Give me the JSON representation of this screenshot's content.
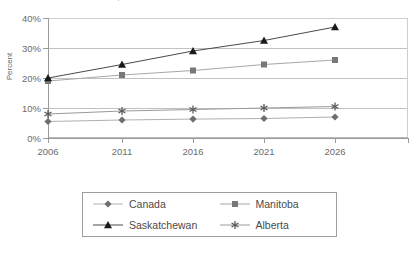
{
  "chart_data": {
    "type": "line",
    "title": "Prairie Provinces, 2006-2026",
    "xlabel": "",
    "ylabel": "Percent",
    "categories": [
      "2006",
      "2011",
      "2016",
      "2021",
      "2026"
    ],
    "x": [
      2006,
      2011,
      2016,
      2021,
      2026
    ],
    "ylim": [
      0,
      40
    ],
    "ytick_labels": [
      "0%",
      "10%",
      "20%",
      "30%",
      "40%"
    ],
    "ytick_values": [
      0,
      10,
      20,
      30,
      40
    ],
    "grid": true,
    "legend_position": "bottom",
    "series": [
      {
        "name": "Canada",
        "marker": "diamond",
        "color": "#6e6e6e",
        "line_color": "#b0b0b0",
        "values": [
          5.5,
          6.0,
          6.3,
          6.5,
          7.0
        ]
      },
      {
        "name": "Manitoba",
        "marker": "square",
        "color": "#787878",
        "line_color": "#a8a8a8",
        "values": [
          19.0,
          21.0,
          22.5,
          24.5,
          26.0
        ]
      },
      {
        "name": "Saskatchewan",
        "marker": "triangle",
        "color": "#1a1a1a",
        "line_color": "#4a4a4a",
        "values": [
          20.0,
          24.5,
          29.0,
          32.5,
          37.0
        ]
      },
      {
        "name": "Alberta",
        "marker": "asterisk",
        "color": "#5a5a5a",
        "line_color": "#9a9a9a",
        "values": [
          8.0,
          9.0,
          9.5,
          10.0,
          10.5
        ]
      }
    ]
  },
  "legend": {
    "entries": [
      {
        "label": "Canada"
      },
      {
        "label": "Manitoba"
      },
      {
        "label": "Saskatchewan"
      },
      {
        "label": "Alberta"
      }
    ]
  }
}
